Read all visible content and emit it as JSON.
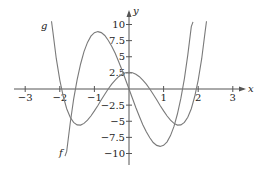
{
  "chart_data": {
    "type": "line",
    "title": "",
    "xlabel": "x",
    "ylabel": "y",
    "xlim": [
      -3.2,
      3.3
    ],
    "ylim": [
      -11,
      11
    ],
    "grid": false,
    "legend": "inline curve labels",
    "x_ticks": [
      -3,
      -2,
      -1,
      1,
      2,
      3
    ],
    "x_tick_labels": [
      "−3",
      "−2",
      "−1",
      "1",
      "2",
      "3"
    ],
    "y_ticks": [
      10,
      7.5,
      5,
      2.5,
      -2.5,
      -5,
      -7.5,
      -10
    ],
    "y_tick_labels": [
      "10",
      "7.5",
      "5",
      "2.5",
      "−2.5",
      "−5",
      "−7.5",
      "−10"
    ],
    "series": [
      {
        "name": "f",
        "label_pos": [
          -1.95,
          -10.1
        ],
        "x": [
          -1.85,
          -1.8,
          -1.7,
          -1.6,
          -1.5,
          -1.4,
          -1.3,
          -1.2,
          -1.1,
          -1.0,
          -0.9,
          -0.8,
          -0.7,
          -0.6,
          -0.5,
          -0.4,
          -0.3,
          -0.2,
          -0.1,
          0,
          0.1,
          0.2,
          0.3,
          0.4,
          0.5,
          0.6,
          0.7,
          0.8,
          0.9,
          1.0,
          1.1,
          1.2,
          1.3,
          1.4,
          1.5,
          1.6,
          1.7,
          1.8,
          1.85
        ],
        "y": [
          -10.4,
          -9.67,
          -5.31,
          -1.62,
          1.42,
          3.88,
          5.8,
          7.22,
          8.18,
          8.73,
          8.9,
          8.74,
          8.29,
          7.57,
          6.64,
          5.53,
          4.27,
          2.91,
          1.47,
          0,
          -1.47,
          -2.91,
          -4.27,
          -5.53,
          -6.64,
          -7.57,
          -8.29,
          -8.74,
          -8.9,
          -8.73,
          -8.18,
          -7.22,
          -5.8,
          -3.88,
          -1.42,
          1.62,
          5.31,
          9.67,
          10.4
        ]
      },
      {
        "name": "g",
        "label_pos": [
          -2.4,
          10.0
        ],
        "x": [
          -2.24,
          -2.2,
          -2.1,
          -2.0,
          -1.9,
          -1.8,
          -1.7,
          -1.6,
          -1.5,
          -1.4,
          -1.3,
          -1.2,
          -1.1,
          -1.0,
          -0.9,
          -0.8,
          -0.7,
          -0.6,
          -0.5,
          -0.4,
          -0.3,
          -0.2,
          -0.1,
          0,
          0.1,
          0.2,
          0.3,
          0.4,
          0.5,
          0.6,
          0.7,
          0.8,
          0.9,
          1.0,
          1.1,
          1.2,
          1.3,
          1.4,
          1.5,
          1.6,
          1.7,
          1.8,
          1.9,
          2.0,
          2.1,
          2.2,
          2.24
        ],
        "y": [
          10.5,
          8.85,
          4.69,
          1.38,
          -1.17,
          -3.06,
          -4.37,
          -5.18,
          -5.57,
          -5.59,
          -5.33,
          -4.84,
          -4.18,
          -3.4,
          -2.56,
          -1.68,
          -0.82,
          0,
          0.74,
          1.38,
          1.9,
          2.29,
          2.52,
          2.6,
          2.52,
          2.29,
          1.9,
          1.38,
          0.74,
          0,
          -0.82,
          -1.68,
          -2.56,
          -3.4,
          -4.18,
          -4.84,
          -5.33,
          -5.59,
          -5.57,
          -5.18,
          -4.37,
          -3.06,
          -1.17,
          1.38,
          4.69,
          8.85,
          10.5
        ]
      }
    ]
  },
  "labels": {
    "x_axis": "x",
    "y_axis": "y",
    "f": "f",
    "g": "g"
  }
}
